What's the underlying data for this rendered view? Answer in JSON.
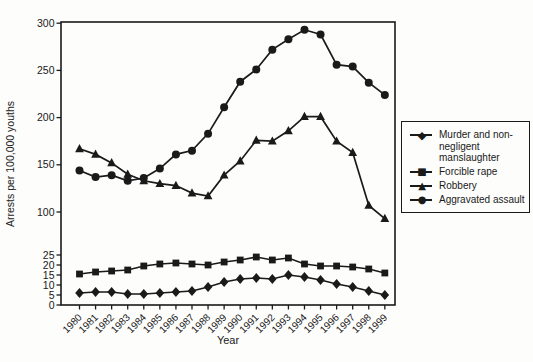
{
  "figure": {
    "background": "#fdfdfc",
    "ink_color": "#1a1a1a"
  },
  "axes": {
    "y_label": "Arrests per 100,000 youths",
    "x_label": "Year",
    "y_ticks_lower": [
      0,
      5,
      10,
      15,
      20,
      25
    ],
    "y_ticks_upper": [
      100,
      150,
      200,
      250,
      300
    ],
    "x_tick_labels": [
      "1980",
      "1981",
      "1982",
      "1983",
      "1984",
      "1985",
      "1986",
      "1987",
      "1988",
      "1989",
      "1990",
      "1991",
      "1992",
      "1993",
      "1994",
      "1995",
      "1996",
      "1997",
      "1998",
      "1999"
    ]
  },
  "legend": {
    "position": "right",
    "items": [
      {
        "marker": "diamond",
        "glyph": "◆",
        "label": "Murder and non-negligent manslaughter"
      },
      {
        "marker": "square",
        "glyph": "■",
        "label": "Forcible rape"
      },
      {
        "marker": "triangle",
        "glyph": "▲",
        "label": "Robbery"
      },
      {
        "marker": "circle",
        "glyph": "●",
        "label": "Aggravated assault"
      }
    ]
  },
  "chart_data": {
    "type": "line",
    "title": "",
    "xlabel": "Year",
    "ylabel": "Arrests per 100,000 youths",
    "x": [
      1980,
      1981,
      1982,
      1983,
      1984,
      1985,
      1986,
      1987,
      1988,
      1989,
      1990,
      1991,
      1992,
      1993,
      1994,
      1995,
      1996,
      1997,
      1998,
      1999
    ],
    "y_axis": {
      "broken": true,
      "lower_segment": {
        "range": [
          0,
          25
        ],
        "ticks": [
          0,
          5,
          10,
          15,
          20,
          25
        ]
      },
      "upper_segment": {
        "range": [
          100,
          300
        ],
        "ticks": [
          100,
          150,
          200,
          250,
          300
        ]
      }
    },
    "grid": false,
    "legend_position": "right",
    "series": [
      {
        "name": "Murder and non-negligent manslaughter",
        "marker": "diamond",
        "values": [
          6,
          6.5,
          6.5,
          5.5,
          5.5,
          6,
          6.5,
          7,
          9,
          11.5,
          13,
          13.5,
          13,
          15,
          14,
          12.5,
          10.5,
          9,
          7,
          5
        ]
      },
      {
        "name": "Forcible rape",
        "marker": "square",
        "values": [
          15.5,
          16.5,
          17,
          17.5,
          19.5,
          20.5,
          21,
          20.5,
          20,
          21.5,
          22.5,
          24,
          22.5,
          23.5,
          20.5,
          19.5,
          19.5,
          19,
          18,
          16
        ]
      },
      {
        "name": "Robbery",
        "marker": "triangle",
        "values": [
          167,
          161,
          152,
          140,
          133,
          130,
          128,
          120,
          117,
          139,
          154,
          176,
          175,
          186,
          201,
          201,
          175,
          163,
          107,
          93
        ]
      },
      {
        "name": "Aggravated assault",
        "marker": "circle",
        "values": [
          144,
          137,
          139,
          133,
          136,
          146,
          161,
          165,
          183,
          211,
          238,
          251,
          272,
          283,
          293,
          288,
          256,
          254,
          237,
          224
        ]
      }
    ]
  }
}
